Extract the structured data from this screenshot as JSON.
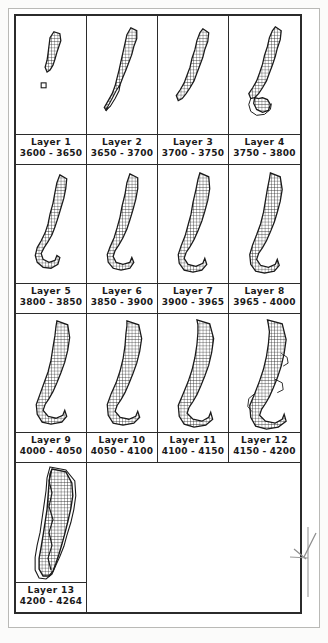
{
  "figure": {
    "type": "layer-plan-grid",
    "columns": 4,
    "rows": 4,
    "annotation_icon": "pencil-arrow-mark"
  },
  "layers": [
    {
      "name": "Layer 1",
      "range": "3600 - 3650",
      "from": 3600,
      "to": 3650
    },
    {
      "name": "Layer 2",
      "range": "3650 - 3700",
      "from": 3650,
      "to": 3700
    },
    {
      "name": "Layer 3",
      "range": "3700 - 3750",
      "from": 3700,
      "to": 3750
    },
    {
      "name": "Layer 4",
      "range": "3750 - 3800",
      "from": 3750,
      "to": 3800
    },
    {
      "name": "Layer 5",
      "range": "3800 - 3850",
      "from": 3800,
      "to": 3850
    },
    {
      "name": "Layer 6",
      "range": "3850 - 3900",
      "from": 3850,
      "to": 3900
    },
    {
      "name": "Layer 7",
      "range": "3900 - 3965",
      "from": 3900,
      "to": 3965
    },
    {
      "name": "Layer 8",
      "range": "3965 - 4000",
      "from": 3965,
      "to": 4000
    },
    {
      "name": "Layer 9",
      "range": "4000 - 4050",
      "from": 4000,
      "to": 4050
    },
    {
      "name": "Layer 10",
      "range": "4050 - 4100",
      "from": 4050,
      "to": 4100
    },
    {
      "name": "Layer 11",
      "range": "4100 - 4150",
      "from": 4100,
      "to": 4150
    },
    {
      "name": "Layer 12",
      "range": "4150 - 4200",
      "from": 4150,
      "to": 4200
    },
    {
      "name": "Layer 13",
      "range": "4200 - 4264",
      "from": 4200,
      "to": 4264
    }
  ],
  "style": {
    "ink": "#1a1a1a",
    "frame": "#2b2b2b",
    "paper": "#ffffff",
    "annotation": "#8d8d8d"
  }
}
